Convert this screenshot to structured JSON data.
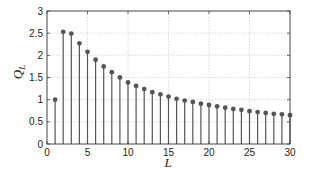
{
  "chart_data": {
    "type": "stem",
    "title": "",
    "xlabel": "L",
    "ylabel": "Q_L",
    "xlim": [
      0,
      30
    ],
    "ylim": [
      0,
      3
    ],
    "xticks": [
      0,
      5,
      10,
      15,
      20,
      25,
      30
    ],
    "yticks": [
      0,
      0.5,
      1,
      1.5,
      2,
      2.5,
      3
    ],
    "ytick_labels": [
      "0",
      "0.5",
      "1",
      "1.5",
      "2",
      "2.5",
      "3"
    ],
    "grid": true,
    "legend": null,
    "x": [
      1,
      2,
      3,
      4,
      5,
      6,
      7,
      8,
      9,
      10,
      11,
      12,
      13,
      14,
      15,
      16,
      17,
      18,
      19,
      20,
      21,
      22,
      23,
      24,
      25,
      26,
      27,
      28,
      29,
      30
    ],
    "values": [
      1.0,
      2.53,
      2.49,
      2.27,
      2.08,
      1.9,
      1.75,
      1.62,
      1.5,
      1.39,
      1.31,
      1.24,
      1.17,
      1.12,
      1.07,
      1.02,
      0.98,
      0.95,
      0.91,
      0.88,
      0.85,
      0.82,
      0.79,
      0.77,
      0.74,
      0.72,
      0.7,
      0.68,
      0.67,
      0.65
    ],
    "colors": {
      "stem": "#555555",
      "marker": "#555555",
      "axis": "#444444",
      "grid": "#cccccc"
    }
  }
}
